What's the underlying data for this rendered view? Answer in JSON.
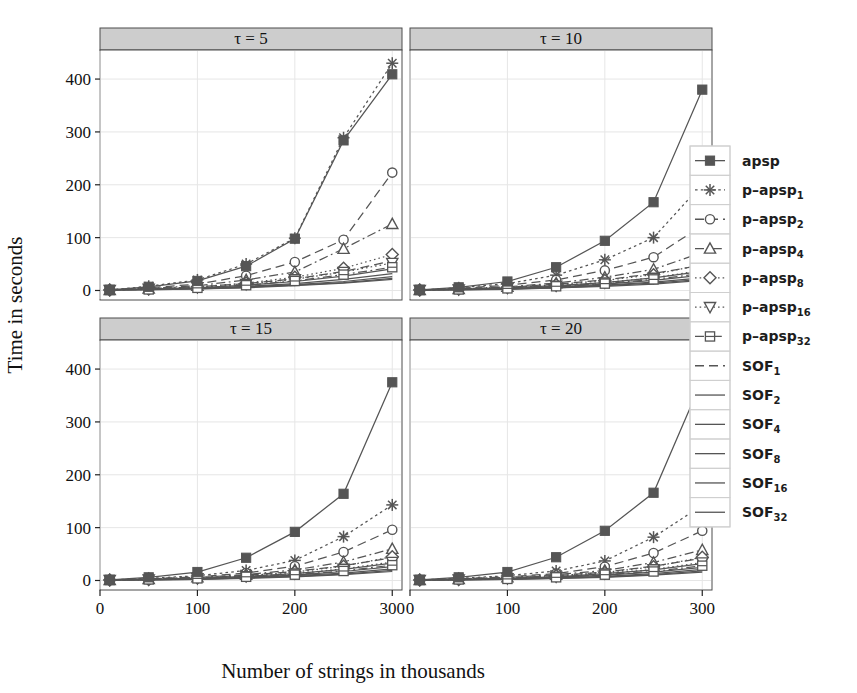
{
  "figure": {
    "background": "#ffffff",
    "panel_background": "#ffffff",
    "strip_background": "#cdcdcd",
    "grid_color": "#e6e6e6",
    "series_color": "#555555",
    "frame_color": "#4d4d4d"
  },
  "chart_data": {
    "type": "line",
    "title": "",
    "xlabel": "Number of strings in thousands",
    "ylabel": "Time in seconds",
    "xlim": [
      0,
      310
    ],
    "ylim": [
      -18,
      455
    ],
    "xticks": [
      0,
      100,
      200,
      300
    ],
    "xtick_labels": [
      "0",
      "100",
      "200",
      "300"
    ],
    "yticks": [
      0,
      100,
      200,
      300,
      400
    ],
    "ytick_labels": [
      "0",
      "100",
      "200",
      "300",
      "400"
    ],
    "grid": true,
    "legend_position": "right",
    "x": [
      10,
      50,
      100,
      150,
      200,
      250,
      300
    ],
    "panels": [
      {
        "id": "tau5",
        "strip_label": "τ = 5",
        "row": 0,
        "col": 0,
        "series": [
          {
            "name": "apsp",
            "values": [
              1,
              7,
              18,
              46,
              98,
              284,
              409
            ]
          },
          {
            "name": "p-apsp1",
            "values": [
              1,
              8,
              20,
              50,
              99,
              289,
              430
            ]
          },
          {
            "name": "p-apsp2",
            "values": [
              1,
              5,
              12,
              28,
              54,
              96,
              223
            ]
          },
          {
            "name": "p-apsp4",
            "values": [
              1,
              4,
              9,
              20,
              35,
              79,
              126
            ]
          },
          {
            "name": "p-apsp8",
            "values": [
              1,
              3,
              7,
              14,
              25,
              42,
              68
            ]
          },
          {
            "name": "p-apsp16",
            "values": [
              1,
              3,
              6,
              12,
              21,
              35,
              52
            ]
          },
          {
            "name": "p-apsp32",
            "values": [
              1,
              2,
              5,
              10,
              18,
              30,
              44
            ]
          },
          {
            "name": "SOF1",
            "values": [
              1,
              3,
              7,
              13,
              22,
              36,
              56
            ]
          },
          {
            "name": "SOF2",
            "values": [
              1,
              2,
              5,
              10,
              17,
              27,
              41
            ]
          },
          {
            "name": "SOF4",
            "values": [
              1,
              2,
              4,
              8,
              13,
              21,
              32
            ]
          },
          {
            "name": "SOF8",
            "values": [
              1,
              2,
              4,
              7,
              11,
              17,
              26
            ]
          },
          {
            "name": "SOF16",
            "values": [
              1,
              2,
              3,
              6,
              10,
              15,
              23
            ]
          },
          {
            "name": "SOF32",
            "values": [
              1,
              1,
              3,
              5,
              9,
              14,
              21
            ]
          }
        ]
      },
      {
        "id": "tau10",
        "strip_label": "τ = 10",
        "row": 0,
        "col": 1,
        "series": [
          {
            "name": "apsp",
            "values": [
              1,
              6,
              17,
              44,
              94,
              167,
              380
            ]
          },
          {
            "name": "p-apsp1",
            "values": [
              1,
              5,
              13,
              29,
              58,
              100,
              201
            ]
          },
          {
            "name": "p-apsp2",
            "values": [
              1,
              4,
              10,
              20,
              38,
              63,
              123
            ]
          },
          {
            "name": "p-apsp4",
            "values": [
              1,
              3,
              7,
              14,
              25,
              40,
              72
            ]
          },
          {
            "name": "p-apsp8",
            "values": [
              1,
              3,
              6,
              11,
              19,
              30,
              49
            ]
          },
          {
            "name": "p-apsp16",
            "values": [
              1,
              2,
              5,
              9,
              15,
              24,
              38
            ]
          },
          {
            "name": "p-apsp32",
            "values": [
              1,
              2,
              4,
              8,
              13,
              21,
              32
            ]
          },
          {
            "name": "SOF1",
            "values": [
              1,
              3,
              6,
              12,
              20,
              32,
              48
            ]
          },
          {
            "name": "SOF2",
            "values": [
              1,
              2,
              5,
              9,
              15,
              24,
              36
            ]
          },
          {
            "name": "SOF4",
            "values": [
              1,
              2,
              4,
              7,
              12,
              19,
              29
            ]
          },
          {
            "name": "SOF8",
            "values": [
              1,
              2,
              3,
              6,
              10,
              16,
              24
            ]
          },
          {
            "name": "SOF16",
            "values": [
              1,
              1,
              3,
              5,
              9,
              14,
              21
            ]
          },
          {
            "name": "SOF32",
            "values": [
              1,
              1,
              2,
              5,
              8,
              12,
              19
            ]
          }
        ]
      },
      {
        "id": "tau15",
        "strip_label": "τ = 15",
        "row": 1,
        "col": 0,
        "series": [
          {
            "name": "apsp",
            "values": [
              1,
              6,
              16,
              43,
              92,
              164,
              375
            ]
          },
          {
            "name": "p-apsp1",
            "values": [
              1,
              4,
              9,
              19,
              38,
              83,
              143
            ]
          },
          {
            "name": "p-apsp2",
            "values": [
              1,
              3,
              7,
              14,
              27,
              54,
              96
            ]
          },
          {
            "name": "p-apsp4",
            "values": [
              1,
              3,
              6,
              11,
              20,
              35,
              60
            ]
          },
          {
            "name": "p-apsp8",
            "values": [
              1,
              2,
              5,
              9,
              16,
              27,
              45
            ]
          },
          {
            "name": "p-apsp16",
            "values": [
              1,
              2,
              4,
              8,
              13,
              22,
              35
            ]
          },
          {
            "name": "p-apsp32",
            "values": [
              1,
              2,
              4,
              7,
              11,
              18,
              29
            ]
          },
          {
            "name": "SOF1",
            "values": [
              1,
              2,
              5,
              10,
              17,
              28,
              43
            ]
          },
          {
            "name": "SOF2",
            "values": [
              1,
              2,
              4,
              8,
              13,
              21,
              33
            ]
          },
          {
            "name": "SOF4",
            "values": [
              1,
              2,
              3,
              6,
              10,
              17,
              26
            ]
          },
          {
            "name": "SOF8",
            "values": [
              1,
              1,
              3,
              5,
              9,
              14,
              22
            ]
          },
          {
            "name": "SOF16",
            "values": [
              1,
              1,
              2,
              5,
              8,
              12,
              19
            ]
          },
          {
            "name": "SOF32",
            "values": [
              1,
              1,
              2,
              4,
              7,
              11,
              17
            ]
          }
        ]
      },
      {
        "id": "tau20",
        "strip_label": "τ = 20",
        "row": 1,
        "col": 1,
        "series": [
          {
            "name": "apsp",
            "values": [
              1,
              6,
              16,
              44,
              94,
              166,
              380
            ]
          },
          {
            "name": "p-apsp1",
            "values": [
              1,
              4,
              9,
              18,
              37,
              82,
              142
            ]
          },
          {
            "name": "p-apsp2",
            "values": [
              1,
              3,
              7,
              13,
              26,
              52,
              94
            ]
          },
          {
            "name": "p-apsp4",
            "values": [
              1,
              3,
              6,
              11,
              19,
              34,
              58
            ]
          },
          {
            "name": "p-apsp8",
            "values": [
              1,
              2,
              5,
              9,
              15,
              26,
              44
            ]
          },
          {
            "name": "p-apsp16",
            "values": [
              1,
              2,
              4,
              7,
              13,
              21,
              34
            ]
          },
          {
            "name": "p-apsp32",
            "values": [
              1,
              2,
              3,
              6,
              11,
              17,
              28
            ]
          },
          {
            "name": "SOF1",
            "values": [
              1,
              2,
              5,
              9,
              16,
              27,
              42
            ]
          },
          {
            "name": "SOF2",
            "values": [
              1,
              2,
              4,
              7,
              13,
              20,
              32
            ]
          },
          {
            "name": "SOF4",
            "values": [
              1,
              2,
              3,
              6,
              10,
              16,
              25
            ]
          },
          {
            "name": "SOF8",
            "values": [
              1,
              1,
              3,
              5,
              8,
              13,
              21
            ]
          },
          {
            "name": "SOF16",
            "values": [
              1,
              1,
              2,
              4,
              7,
              11,
              18
            ]
          },
          {
            "name": "SOF32",
            "values": [
              1,
              1,
              2,
              4,
              6,
              10,
              16
            ]
          }
        ]
      }
    ],
    "legend": {
      "entries": [
        {
          "key": "apsp",
          "base": "apsp",
          "sub": "",
          "marker": "square-filled",
          "dash": "solid"
        },
        {
          "key": "p-apsp1",
          "base": "p–apsp",
          "sub": "1",
          "marker": "asterisk",
          "dash": "dot"
        },
        {
          "key": "p-apsp2",
          "base": "p–apsp",
          "sub": "2",
          "marker": "circle",
          "dash": "dash"
        },
        {
          "key": "p-apsp4",
          "base": "p–apsp",
          "sub": "4",
          "marker": "triangle-up",
          "dash": "dashdot"
        },
        {
          "key": "p-apsp8",
          "base": "p–apsp",
          "sub": "8",
          "marker": "diamond",
          "dash": "dotfine"
        },
        {
          "key": "p-apsp16",
          "base": "p–apsp",
          "sub": "16",
          "marker": "triangle-down",
          "dash": "dotfine"
        },
        {
          "key": "p-apsp32",
          "base": "p–apsp",
          "sub": "32",
          "marker": "square-open",
          "dash": "dashdot"
        },
        {
          "key": "SOF1",
          "base": "SOF",
          "sub": "1",
          "marker": "none",
          "dash": "dash"
        },
        {
          "key": "SOF2",
          "base": "SOF",
          "sub": "2",
          "marker": "none",
          "dash": "solid"
        },
        {
          "key": "SOF4",
          "base": "SOF",
          "sub": "4",
          "marker": "none",
          "dash": "solid"
        },
        {
          "key": "SOF8",
          "base": "SOF",
          "sub": "8",
          "marker": "none",
          "dash": "solid"
        },
        {
          "key": "SOF16",
          "base": "SOF",
          "sub": "16",
          "marker": "none",
          "dash": "solid"
        },
        {
          "key": "SOF32",
          "base": "SOF",
          "sub": "32",
          "marker": "none",
          "dash": "solid"
        }
      ]
    }
  }
}
